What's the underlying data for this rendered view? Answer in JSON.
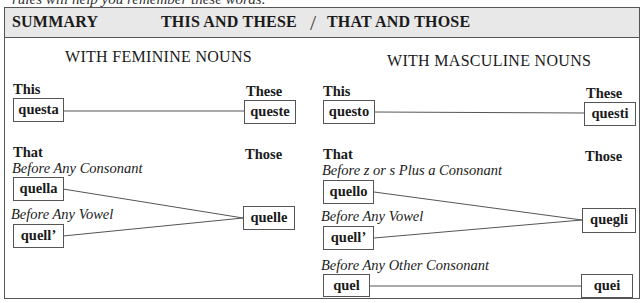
{
  "intro_text": "rules will help you remember these words.",
  "header": {
    "summary_label": "SUMMARY",
    "title_left": "THIS AND THESE",
    "separator": "/",
    "title_right": "THAT AND THOSE"
  },
  "feminine": {
    "section_title": "WITH FEMININE NOUNS",
    "this_label": "This",
    "these_label": "These",
    "this_form": "questa",
    "these_form": "queste",
    "that_label": "That",
    "those_label": "Those",
    "conditions": [
      {
        "label": "Before Any Consonant",
        "form": "quella"
      },
      {
        "label": "Before Any Vowel",
        "form": "quell’"
      }
    ],
    "those_form": "quelle"
  },
  "masculine": {
    "section_title": "WITH MASCULINE NOUNS",
    "this_label": "This",
    "these_label": "These",
    "this_form": "questo",
    "these_form": "questi",
    "that_label": "That",
    "those_label": "Those",
    "conditions": [
      {
        "label": "Before z or s Plus a Consonant",
        "form": "quello"
      },
      {
        "label": "Before Any Vowel",
        "form": "quell’"
      },
      {
        "label": "Before Any Other Consonant",
        "form": "quel"
      }
    ],
    "those_forms": [
      "quegli",
      "quei"
    ]
  }
}
